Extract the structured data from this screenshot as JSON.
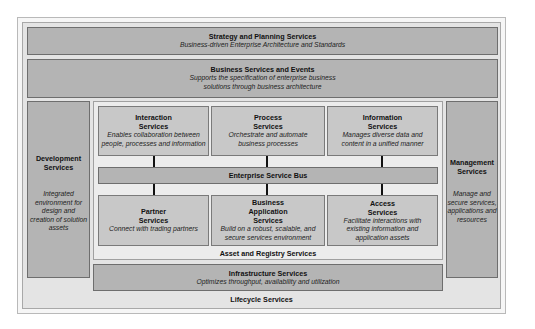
{
  "diagram": {
    "strategy": {
      "title": "Strategy and Planning Services",
      "desc": "Business-driven Enterprise Architecture and Standards"
    },
    "business_services": {
      "title": "Business Services and Events",
      "desc_line1": "Supports the specification of enterprise business",
      "desc_line2": "solutions through business architecture"
    },
    "development": {
      "title_line1": "Development",
      "title_line2": "Services",
      "desc_lines": [
        "Integrated",
        "environment for",
        "design and",
        "creation of solution",
        "assets"
      ]
    },
    "management": {
      "title_line1": "Management",
      "title_line2": "Services",
      "desc_lines": [
        "Manage and",
        "secure services,",
        "applications and",
        "resources"
      ]
    },
    "top_row": [
      {
        "title_line1": "Interaction",
        "title_line2": "Services",
        "desc_lines": [
          "Enables collaboration between",
          "people, processes and information"
        ]
      },
      {
        "title_line1": "Process",
        "title_line2": "Services",
        "desc_lines": [
          "Orchestrate and automate",
          "business processes"
        ]
      },
      {
        "title_line1": "Information",
        "title_line2": "Services",
        "desc_lines": [
          "Manages diverse data and",
          "content in a unified manner"
        ]
      }
    ],
    "esb": {
      "title": "Enterprise Service Bus"
    },
    "bottom_row": [
      {
        "title_lines": [
          "Partner",
          "Services"
        ],
        "desc_lines": [
          "Connect with trading partners"
        ]
      },
      {
        "title_lines": [
          "Business",
          "Application",
          "Services"
        ],
        "desc_lines": [
          "Build on a robust, scalable, and",
          "secure services environment"
        ]
      },
      {
        "title_lines": [
          "Access",
          "Services"
        ],
        "desc_lines": [
          "Facilitate interactions with",
          "existing information and",
          "application assets"
        ]
      }
    ],
    "asset_registry": {
      "title": "Asset and Registry Services"
    },
    "infrastructure": {
      "title": "Infrastructure Services",
      "desc": "Optimizes throughput, availability and utilization"
    },
    "lifecycle": {
      "title": "Lifecycle Services"
    },
    "colors": {
      "dark_box": "#b4b4b4",
      "mid_box": "#c8c8c8",
      "panel": "#ececec",
      "frame": "#e4e4e4",
      "connector": "#111111"
    }
  }
}
